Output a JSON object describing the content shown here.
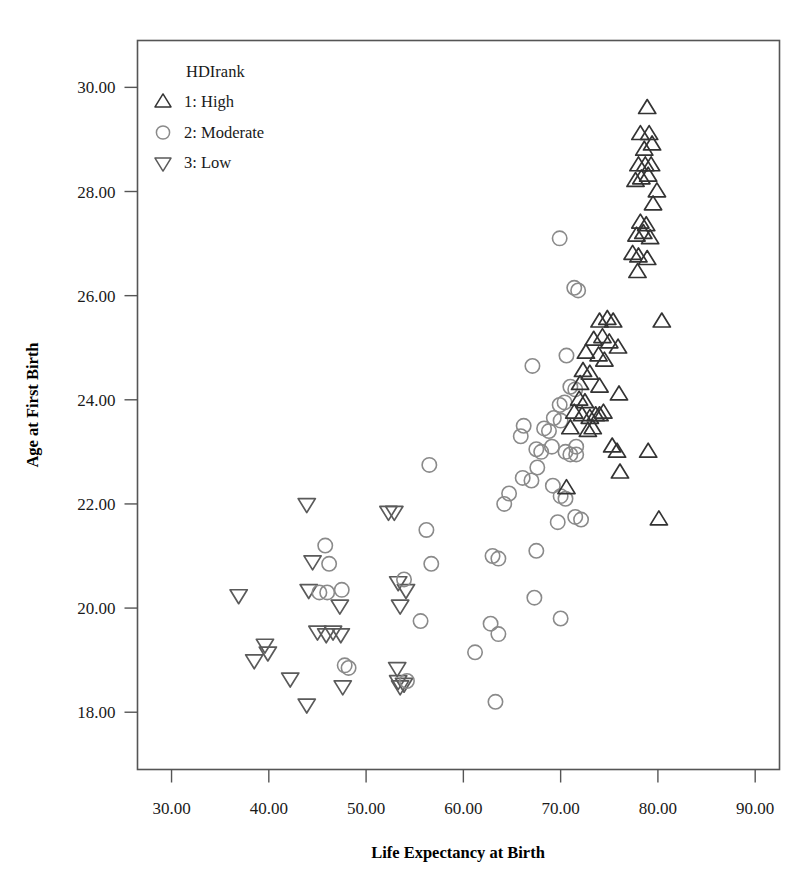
{
  "chart_data": {
    "type": "scatter",
    "title": "",
    "xlabel": "Life Expectancy at Birth",
    "ylabel": "Age at First Birth",
    "xlim": [
      26.5,
      92.5
    ],
    "ylim": [
      16.9,
      30.9
    ],
    "xticks": [
      "30.00",
      "40.00",
      "50.00",
      "60.00",
      "70.00",
      "80.00",
      "90.00"
    ],
    "xtick_values": [
      30,
      40,
      50,
      60,
      70,
      80,
      90
    ],
    "yticks": [
      "18.00",
      "20.00",
      "22.00",
      "24.00",
      "26.00",
      "28.00",
      "30.00"
    ],
    "ytick_values": [
      18,
      20,
      22,
      24,
      26,
      28,
      30
    ],
    "grid": false,
    "legend": {
      "title": "HDIrank",
      "position": "top-left-inside",
      "entries": [
        {
          "label": "1: High",
          "marker": "triangle-up",
          "color": "#333333"
        },
        {
          "label": "2: Moderate",
          "marker": "circle",
          "color": "#8a8a8a"
        },
        {
          "label": "3: Low",
          "marker": "triangle-down",
          "color": "#5a5a5a"
        }
      ]
    },
    "series": [
      {
        "name": "1: High",
        "marker": "triangle-up",
        "color": "#333333",
        "points": [
          [
            78.9,
            29.6
          ],
          [
            78.2,
            29.1
          ],
          [
            79.1,
            29.1
          ],
          [
            78.6,
            28.8
          ],
          [
            79.4,
            28.9
          ],
          [
            78.0,
            28.5
          ],
          [
            78.7,
            28.5
          ],
          [
            79.3,
            28.5
          ],
          [
            77.7,
            28.2
          ],
          [
            78.3,
            28.25
          ],
          [
            79.0,
            28.3
          ],
          [
            79.9,
            28.0
          ],
          [
            79.5,
            27.75
          ],
          [
            78.2,
            27.4
          ],
          [
            78.8,
            27.35
          ],
          [
            77.8,
            27.15
          ],
          [
            78.5,
            27.2
          ],
          [
            79.2,
            27.1
          ],
          [
            77.4,
            26.8
          ],
          [
            78.0,
            26.75
          ],
          [
            78.9,
            26.7
          ],
          [
            77.9,
            26.45
          ],
          [
            74.0,
            25.5
          ],
          [
            74.8,
            25.55
          ],
          [
            75.4,
            25.5
          ],
          [
            80.4,
            25.5
          ],
          [
            73.4,
            25.15
          ],
          [
            74.3,
            25.2
          ],
          [
            75.0,
            25.1
          ],
          [
            75.9,
            25.0
          ],
          [
            72.6,
            24.9
          ],
          [
            73.9,
            24.85
          ],
          [
            74.5,
            24.75
          ],
          [
            72.3,
            24.55
          ],
          [
            73.0,
            24.5
          ],
          [
            72.0,
            24.3
          ],
          [
            74.0,
            24.25
          ],
          [
            76.0,
            24.1
          ],
          [
            71.9,
            24.0
          ],
          [
            72.5,
            23.95
          ],
          [
            71.4,
            23.75
          ],
          [
            72.2,
            23.7
          ],
          [
            73.0,
            23.65
          ],
          [
            73.6,
            23.7
          ],
          [
            74.0,
            23.7
          ],
          [
            74.4,
            23.75
          ],
          [
            71.0,
            23.45
          ],
          [
            72.8,
            23.4
          ],
          [
            73.3,
            23.45
          ],
          [
            75.3,
            23.1
          ],
          [
            75.8,
            23.0
          ],
          [
            79.0,
            23.0
          ],
          [
            76.1,
            22.6
          ],
          [
            70.6,
            22.3
          ],
          [
            80.1,
            21.7
          ]
        ]
      },
      {
        "name": "2: Moderate",
        "marker": "circle",
        "color": "#8a8a8a",
        "points": [
          [
            69.9,
            27.1
          ],
          [
            71.4,
            26.15
          ],
          [
            71.8,
            26.1
          ],
          [
            70.6,
            24.85
          ],
          [
            67.1,
            24.65
          ],
          [
            71.0,
            24.25
          ],
          [
            71.5,
            24.2
          ],
          [
            69.9,
            23.9
          ],
          [
            70.4,
            23.95
          ],
          [
            69.3,
            23.65
          ],
          [
            70.0,
            23.6
          ],
          [
            66.2,
            23.5
          ],
          [
            68.3,
            23.45
          ],
          [
            68.8,
            23.4
          ],
          [
            65.9,
            23.3
          ],
          [
            69.1,
            23.1
          ],
          [
            71.6,
            23.1
          ],
          [
            67.5,
            23.05
          ],
          [
            68.0,
            23.0
          ],
          [
            70.5,
            23.0
          ],
          [
            71.0,
            22.95
          ],
          [
            71.6,
            22.95
          ],
          [
            67.6,
            22.7
          ],
          [
            56.5,
            22.75
          ],
          [
            66.1,
            22.5
          ],
          [
            67.0,
            22.45
          ],
          [
            69.2,
            22.35
          ],
          [
            64.7,
            22.2
          ],
          [
            70.0,
            22.15
          ],
          [
            70.5,
            22.1
          ],
          [
            64.2,
            22.0
          ],
          [
            71.5,
            21.75
          ],
          [
            72.1,
            21.7
          ],
          [
            69.7,
            21.65
          ],
          [
            56.2,
            21.5
          ],
          [
            67.5,
            21.1
          ],
          [
            63.0,
            21.0
          ],
          [
            63.6,
            20.95
          ],
          [
            45.8,
            21.2
          ],
          [
            46.2,
            20.85
          ],
          [
            56.7,
            20.85
          ],
          [
            53.9,
            20.55
          ],
          [
            47.5,
            20.35
          ],
          [
            46.0,
            20.3
          ],
          [
            45.2,
            20.3
          ],
          [
            67.3,
            20.2
          ],
          [
            70.0,
            19.8
          ],
          [
            55.6,
            19.75
          ],
          [
            63.6,
            19.5
          ],
          [
            62.8,
            19.7
          ],
          [
            61.2,
            19.15
          ],
          [
            47.8,
            18.9
          ],
          [
            48.2,
            18.85
          ],
          [
            54.2,
            18.6
          ],
          [
            63.3,
            18.2
          ]
        ]
      },
      {
        "name": "3: Low",
        "marker": "triangle-down",
        "color": "#5a5a5a",
        "points": [
          [
            43.9,
            22.0
          ],
          [
            52.3,
            21.85
          ],
          [
            52.9,
            21.85
          ],
          [
            44.5,
            20.9
          ],
          [
            44.1,
            20.35
          ],
          [
            53.3,
            20.5
          ],
          [
            47.3,
            20.05
          ],
          [
            54.1,
            20.35
          ],
          [
            36.9,
            20.25
          ],
          [
            53.5,
            20.05
          ],
          [
            45.0,
            19.55
          ],
          [
            45.9,
            19.5
          ],
          [
            46.6,
            19.55
          ],
          [
            47.4,
            19.5
          ],
          [
            39.6,
            19.3
          ],
          [
            38.5,
            19.0
          ],
          [
            39.9,
            19.15
          ],
          [
            42.2,
            18.65
          ],
          [
            47.6,
            18.5
          ],
          [
            53.2,
            18.85
          ],
          [
            53.3,
            18.6
          ],
          [
            53.9,
            18.55
          ],
          [
            43.9,
            18.15
          ],
          [
            53.5,
            18.5
          ]
        ]
      }
    ]
  },
  "axis": {
    "x_title": "Life Expectancy at Birth",
    "y_title": "Age at First Birth"
  }
}
